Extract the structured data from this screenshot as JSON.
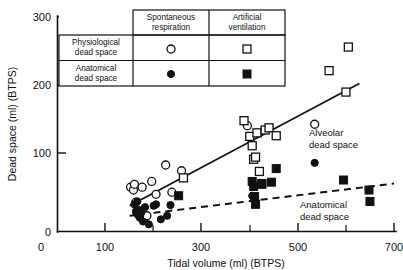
{
  "chart_data": {
    "type": "scatter",
    "title": "",
    "xlabel": "Tidal volume (ml) (BTPS)",
    "ylabel": "Dead space (ml) (BTPS)",
    "xlim": [
      0,
      700
    ],
    "ylim": [
      0,
      300
    ],
    "grid": false,
    "x_ticks_labeled": [
      0,
      100,
      300,
      500,
      700
    ],
    "x_ticks_minor": [
      200,
      400,
      600
    ],
    "y_ticks_labeled": [
      0,
      100,
      200,
      300
    ],
    "legend_position": "inset-top-center",
    "series": [
      {
        "name": "Physiological dead space, spontaneous respiration",
        "marker": "open-circle",
        "points": [
          [
            152,
            62
          ],
          [
            158,
            58
          ],
          [
            160,
            66
          ],
          [
            163,
            41
          ],
          [
            168,
            24
          ],
          [
            172,
            20
          ],
          [
            176,
            62
          ],
          [
            180,
            18
          ],
          [
            186,
            22
          ],
          [
            196,
            70
          ],
          [
            205,
            52
          ],
          [
            225,
            93
          ],
          [
            238,
            55
          ],
          [
            258,
            85
          ],
          [
            395,
            148
          ],
          [
            535,
            150
          ]
        ]
      },
      {
        "name": "Anatomical dead space, spontaneous respiration",
        "marker": "filled-circle",
        "points": [
          [
            160,
            38
          ],
          [
            163,
            28
          ],
          [
            166,
            42
          ],
          [
            168,
            24
          ],
          [
            170,
            30
          ],
          [
            172,
            20
          ],
          [
            174,
            26
          ],
          [
            178,
            14
          ],
          [
            182,
            34
          ],
          [
            190,
            10
          ],
          [
            200,
            36
          ],
          [
            205,
            38
          ],
          [
            215,
            17
          ],
          [
            228,
            22
          ],
          [
            235,
            37
          ],
          [
            405,
            50
          ],
          [
            535,
            96
          ]
        ]
      },
      {
        "name": "Physiological dead space, artificial ventilation",
        "marker": "open-square",
        "points": [
          [
            262,
            75
          ],
          [
            388,
            155
          ],
          [
            400,
            133
          ],
          [
            405,
            120
          ],
          [
            408,
            101
          ],
          [
            412,
            104
          ],
          [
            415,
            138
          ],
          [
            420,
            84
          ],
          [
            425,
            67
          ],
          [
            432,
            142
          ],
          [
            440,
            145
          ],
          [
            455,
            134
          ],
          [
            565,
            225
          ],
          [
            605,
            258
          ],
          [
            600,
            195
          ]
        ]
      },
      {
        "name": "Anatomical dead space, artificial ventilation",
        "marker": "filled-square",
        "points": [
          [
            252,
            50
          ],
          [
            405,
            70
          ],
          [
            408,
            63
          ],
          [
            410,
            49
          ],
          [
            412,
            38
          ],
          [
            425,
            66
          ],
          [
            445,
            69
          ],
          [
            455,
            88
          ],
          [
            595,
            72
          ],
          [
            648,
            58
          ],
          [
            650,
            42
          ]
        ]
      }
    ],
    "fit_lines": [
      {
        "name": "Alveolar dead space regression",
        "style": "solid",
        "x": [
          150,
          628
        ],
        "y": [
          36,
          207
        ]
      },
      {
        "name": "Anatomical dead space regression",
        "style": "dashed",
        "x": [
          150,
          700
        ],
        "y": [
          22,
          67
        ]
      }
    ],
    "annotations": [
      {
        "text_line1": "Alveolar",
        "text_line2": "dead space",
        "x": 520,
        "y": 143
      },
      {
        "text_line1": "Anatomical",
        "text_line2": "dead space",
        "x": 505,
        "y": 33
      }
    ]
  },
  "axes": {
    "y_title": "Dead space (ml) (BTPS)",
    "x_title": "Tidal volume (ml) (BTPS)",
    "y_tick_labels": [
      "300",
      "200",
      "100",
      "0"
    ],
    "x_tick_labels": [
      "0",
      "100",
      "300",
      "500",
      "700"
    ]
  },
  "legend": {
    "col_headers": [
      {
        "line1": "Spontaneous",
        "line2": "respiration"
      },
      {
        "line1": "Artificial",
        "line2": "ventilation"
      }
    ],
    "rows": [
      {
        "line1": "Physiological",
        "line2": "dead space",
        "marker_spontaneous": "open-circle",
        "marker_artificial": "open-square"
      },
      {
        "line1": "Anatomical",
        "line2": "dead space",
        "marker_spontaneous": "filled-circle",
        "marker_artificial": "filled-square"
      }
    ]
  },
  "colors": {
    "ink": "#111111",
    "background": "#ffffff"
  }
}
